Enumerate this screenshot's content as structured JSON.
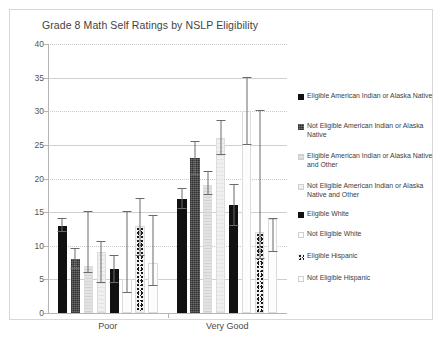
{
  "chart_data": {
    "type": "bar",
    "title": "Grade 8 Math Self Ratings by NSLP Eligibility",
    "xlabel": "",
    "ylabel": "",
    "categories": [
      "Poor",
      "Very Good"
    ],
    "ylim": [
      0,
      40
    ],
    "yticks": [
      0,
      5,
      10,
      15,
      20,
      25,
      30,
      35,
      40
    ],
    "grid": true,
    "legend_position": "right",
    "error_bars": true,
    "series": [
      {
        "name": "Eligible American Indian or Alaska Native",
        "fill": "solid-black",
        "values": [
          13.0,
          17.0
        ],
        "err_low": [
          1.0,
          1.5
        ],
        "err_high": [
          1.0,
          1.5
        ]
      },
      {
        "name": "Not Eligible American Indian or Alaska Native",
        "fill": "dark-hatch",
        "values": [
          8.0,
          23.0
        ],
        "err_low": [
          1.5,
          2.5
        ],
        "err_high": [
          1.5,
          2.5
        ]
      },
      {
        "name": "Eligible American Indian or Alaska Native and Other",
        "fill": "light-gray",
        "values": [
          7.0,
          19.0
        ],
        "err_low": [
          1.0,
          1.5
        ],
        "err_high": [
          8.0,
          2.0
        ]
      },
      {
        "name": "Not Eligible American Indian or Alaska Native and Other",
        "fill": "very-light",
        "values": [
          9.0,
          26.0
        ],
        "err_low": [
          4.5,
          2.5
        ],
        "err_high": [
          1.5,
          2.5
        ]
      },
      {
        "name": "Eligible White",
        "fill": "solid-black",
        "values": [
          6.5,
          16.0
        ],
        "err_low": [
          2.0,
          3.0
        ],
        "err_high": [
          2.0,
          3.0
        ]
      },
      {
        "name": "Not Eligible White",
        "fill": "white",
        "values": [
          5.0,
          30.0
        ],
        "err_low": [
          2.0,
          5.0
        ],
        "err_high": [
          10.0,
          5.0
        ]
      },
      {
        "name": "Eligible Hispanic",
        "fill": "speckle",
        "values": [
          13.0,
          12.0
        ],
        "err_low": [
          4.5,
          4.0
        ],
        "err_high": [
          4.0,
          18.0
        ]
      },
      {
        "name": "Not Eligible Hispanic",
        "fill": "white",
        "values": [
          7.5,
          14.0
        ],
        "err_low": [
          3.5,
          5.0
        ],
        "err_high": [
          7.0,
          0.0
        ]
      }
    ]
  },
  "legend": {
    "items": [
      {
        "label": "Eligible American Indian or Alaska Native",
        "swatch": "solid-black"
      },
      {
        "label": "Not Eligible American Indian or Alaska Native",
        "swatch": "dark-hatch"
      },
      {
        "label": "Eligible American Indian or Alaska Native and Other",
        "swatch": "light-gray"
      },
      {
        "label": "Not Eligible American Indian or Alaska Native and Other",
        "swatch": "very-light"
      },
      {
        "label": "Eligible White",
        "swatch": "solid-black"
      },
      {
        "label": "Not Eligible White",
        "swatch": "white"
      },
      {
        "label": "Eligible Hispanic",
        "swatch": "speckle"
      },
      {
        "label": "Not Eligible Hispanic",
        "swatch": "white"
      }
    ]
  },
  "colors": {
    "frame_border": "#d8d8d8",
    "axis": "#b5b5b5",
    "gridline": "#c9c9c9",
    "text": "#3d3d3d",
    "bar_black": "#111111",
    "bar_dark": "#6f6f6f",
    "bar_light": "#e3e3e3",
    "error_bar": "#6a6a6a"
  }
}
